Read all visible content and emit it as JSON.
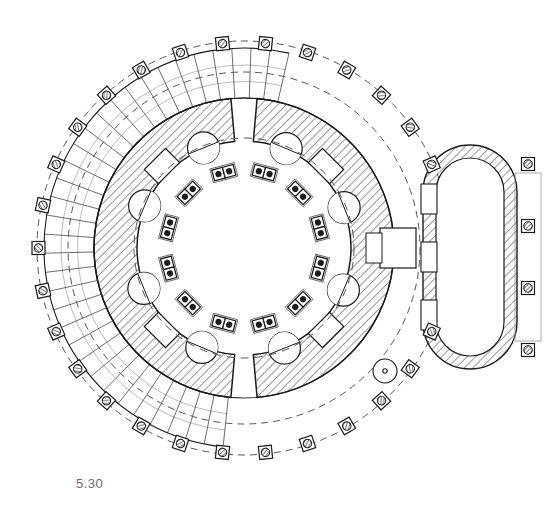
{
  "figure": {
    "caption_number": "5.30",
    "kind": "architectural-floor-plan",
    "ink_color": "#1c1c1c",
    "hatch_color": "#444444",
    "dash_color": "#555555",
    "caption_color": "#6e6e6e",
    "paper_color": "#ffffff"
  },
  "geometry": {
    "center": {
      "x": 244,
      "y": 248
    },
    "outer_colonnade_radius": 207,
    "colonnade_inner_dashed_radius": 176,
    "step_band_outer_radius": 200,
    "step_band_inner_radius": 150,
    "rotunda_wall_outer_radius": 150,
    "rotunda_wall_inner_radius": 107,
    "inner_chamber_radius": 107,
    "seat_ring_radius": 78
  },
  "outer_colonnade": {
    "label": "peristyle column ring",
    "column_count": 30,
    "start_angle_deg": -96,
    "column_square_size": 13,
    "column_circle_radius": 4.2,
    "note": "square plinths with hatched round column shafts on dashed stylobate circle"
  },
  "step_band": {
    "label": "radial stepped podium / stairs",
    "step_count": 34,
    "start_angle_deg": 96,
    "end_angle_deg": 283,
    "note": "fine radial ruled lines between stylobate and cella wall, left and top-left sector"
  },
  "rotunda_wall": {
    "label": "hatched cella wall ring",
    "gap_top_half_width_deg": 5,
    "gap_bottom_half_width_deg": 5,
    "niche_count": 8,
    "niche_radius": 16,
    "recess_count": 4,
    "recess_width": 30,
    "recess_depth": 20
  },
  "inner_seats": {
    "label": "paired seat / column blocks in the central chamber",
    "pair_count": 12,
    "ring_radius": 78,
    "block_width": 11,
    "block_height": 11,
    "dot_radius": 3.1
  },
  "annex": {
    "label": "oval annex chamber east",
    "shape": "stadium / elongated oval",
    "center_x": 470,
    "center_y": 257,
    "half_width": 47,
    "half_height": 112,
    "wall_thickness": 13,
    "column_count": 4,
    "column_square_size": 13,
    "column_circle_radius": 4.2,
    "niche_count": 3
  },
  "stair_well": {
    "label": "spiral stair",
    "x": 385,
    "y": 371,
    "outer_radius": 12,
    "pivot_radius": 2.2
  },
  "passage": {
    "label": "axial passage linking rotunda to annex",
    "x": 398,
    "y": 248,
    "width": 36,
    "height": 40
  }
}
